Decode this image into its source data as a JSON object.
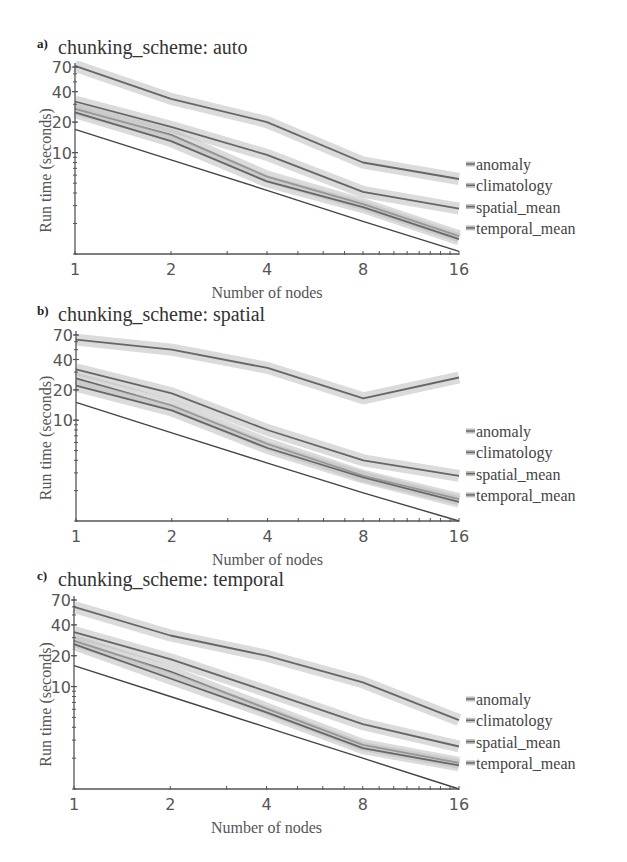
{
  "chart_data": [
    {
      "type": "line",
      "panel": "a)",
      "title": "chunking_scheme: auto",
      "xlabel": "Number of nodes",
      "ylabel": "Run time (seconds)",
      "xscale": "log2",
      "yscale": "log10",
      "x": [
        1,
        2,
        4,
        8,
        16
      ],
      "xticks": [
        "1",
        "2",
        "4",
        "8",
        "16"
      ],
      "yticks": [
        "10",
        "20",
        "40",
        "70"
      ],
      "ylim": [
        1,
        70
      ],
      "xlim": [
        1,
        16
      ],
      "grid": false,
      "legend_position": "right",
      "series": [
        {
          "name": "anomaly",
          "values": [
            72,
            34,
            20,
            8,
            5.5
          ]
        },
        {
          "name": "climatology",
          "values": [
            32,
            18,
            9.5,
            4.1,
            2.8
          ]
        },
        {
          "name": "spatial_mean",
          "values": [
            27,
            15,
            5.8,
            3.1,
            1.5
          ]
        },
        {
          "name": "temporal_mean",
          "values": [
            25,
            13,
            5.2,
            2.9,
            1.4
          ]
        },
        {
          "name": "ideal_scaling",
          "values": [
            17,
            8.5,
            4.25,
            2.1,
            1.06
          ],
          "in_legend": false
        }
      ]
    },
    {
      "type": "line",
      "panel": "b)",
      "title": "chunking_scheme: spatial",
      "xlabel": "Number of nodes",
      "ylabel": "Run time (seconds)",
      "xscale": "log2",
      "yscale": "log10",
      "x": [
        1,
        2,
        4,
        8,
        16
      ],
      "xticks": [
        "1",
        "2",
        "4",
        "8",
        "16"
      ],
      "yticks": [
        "10",
        "20",
        "40",
        "70"
      ],
      "ylim": [
        1,
        70
      ],
      "xlim": [
        1,
        16
      ],
      "grid": false,
      "legend_position": "right",
      "series": [
        {
          "name": "anomaly",
          "values": [
            63,
            50,
            33,
            16.5,
            26.5
          ]
        },
        {
          "name": "climatology",
          "values": [
            32,
            18.5,
            8,
            4.0,
            2.8
          ]
        },
        {
          "name": "spatial_mean",
          "values": [
            26,
            14,
            5.8,
            2.8,
            1.65
          ]
        },
        {
          "name": "temporal_mean",
          "values": [
            22,
            12.5,
            5.3,
            2.7,
            1.55
          ]
        },
        {
          "name": "ideal_scaling",
          "values": [
            15,
            7.5,
            3.75,
            1.9,
            1.0
          ],
          "in_legend": false
        }
      ]
    },
    {
      "type": "line",
      "panel": "c)",
      "title": "chunking_scheme: temporal",
      "xlabel": "Number of nodes",
      "ylabel": "Run time (seconds)",
      "xscale": "log2",
      "yscale": "log10",
      "x": [
        1,
        2,
        4,
        8,
        16
      ],
      "xticks": [
        "1",
        "2",
        "4",
        "8",
        "16"
      ],
      "yticks": [
        "10",
        "20",
        "40",
        "70"
      ],
      "ylim": [
        1,
        70
      ],
      "xlim": [
        1,
        16
      ],
      "grid": false,
      "legend_position": "right",
      "series": [
        {
          "name": "anomaly",
          "values": [
            60,
            31.5,
            20,
            11,
            4.7
          ]
        },
        {
          "name": "climatology",
          "values": [
            34,
            18.5,
            9,
            4.3,
            2.6
          ]
        },
        {
          "name": "spatial_mean",
          "values": [
            28,
            14,
            6.1,
            2.7,
            1.8
          ]
        },
        {
          "name": "temporal_mean",
          "values": [
            26,
            12,
            5.6,
            2.5,
            1.7
          ]
        },
        {
          "name": "ideal_scaling",
          "values": [
            16,
            8,
            4,
            2,
            1.0
          ],
          "in_legend": false
        }
      ]
    }
  ],
  "style": {
    "line_color": "#666666",
    "band_color": "#bdbdbd",
    "axis_color": "#555555",
    "ideal_color": "#444444"
  },
  "legend": {
    "items": [
      "anomaly",
      "climatology",
      "spatial_mean",
      "temporal_mean"
    ]
  }
}
